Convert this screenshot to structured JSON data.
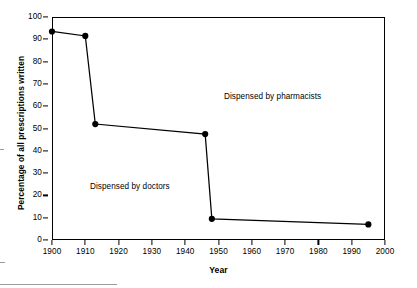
{
  "chart_data": {
    "type": "line",
    "title": "",
    "subtitle": "",
    "xlabel": "Year",
    "ylabel": "Percentage of all prescriptions written",
    "xlim": [
      1900,
      2000
    ],
    "ylim": [
      0,
      100
    ],
    "xticks": [
      1900,
      1910,
      1920,
      1930,
      1940,
      1950,
      1960,
      1970,
      1980,
      1990,
      2000
    ],
    "yticks": [
      0,
      10,
      20,
      30,
      40,
      50,
      60,
      70,
      80,
      90,
      100
    ],
    "grid": false,
    "legend": false,
    "legend_position": "none",
    "marker": "filled-circle",
    "line_color": "#000000",
    "marker_color": "#000000",
    "series": [
      {
        "name": "Percentage of all prescriptions written",
        "x": [
          1900,
          1910,
          1913,
          1946,
          1948,
          1995
        ],
        "values": [
          93.5,
          91.5,
          52.0,
          47.5,
          9.5,
          7.0
        ]
      }
    ],
    "annotations": [
      {
        "text": "Dispensed by pharmacists",
        "x": 1955,
        "y": 66
      },
      {
        "text": "Dispensed by doctors",
        "x": 1916,
        "y": 26
      }
    ]
  },
  "axes": {
    "x_title": "Year",
    "y_title": "Percentage of all prescriptions written",
    "x_tick_labels": [
      "1900",
      "1910",
      "1920",
      "1930",
      "1940",
      "1950",
      "1960",
      "1970",
      "1980",
      "1990",
      "2000"
    ],
    "y_tick_labels": [
      "0",
      "10",
      "20",
      "30",
      "40",
      "50",
      "60",
      "70",
      "80",
      "90",
      "100"
    ]
  },
  "annotations": {
    "pharmacists": "Dispensed by pharmacists",
    "doctors": "Dispensed by doctors"
  }
}
